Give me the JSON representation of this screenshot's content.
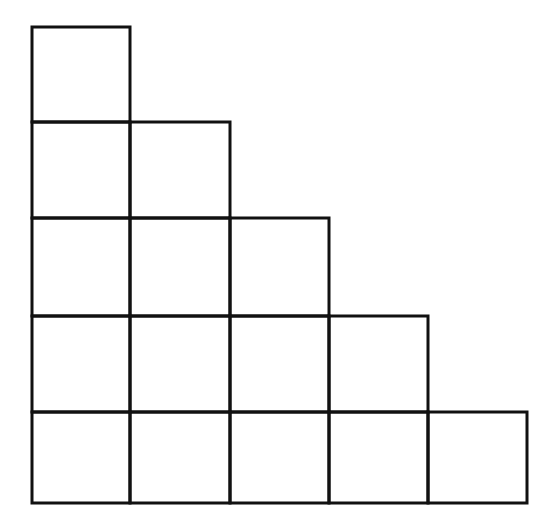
{
  "diagram": {
    "type": "staircase-grid",
    "row_lengths_top_to_bottom": [
      1,
      2,
      3,
      4,
      5
    ],
    "total_cells": 15,
    "line_color": "#111111",
    "background": "#ffffff",
    "col_x": [
      32,
      130,
      230,
      329,
      428,
      527
    ],
    "row_y": [
      27,
      122,
      218,
      316,
      412,
      503
    ]
  }
}
